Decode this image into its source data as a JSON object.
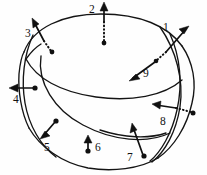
{
  "figure": {
    "background_color": "#fefefe",
    "ink_color": "#111111",
    "width": 207,
    "height": 175,
    "surface": {
      "description": "self-intersecting torus-like closed surface drawn as overlapping elliptical curves",
      "curve_count": 7
    },
    "vectors": [
      {
        "id": "1",
        "label": "1",
        "direction": "up-right",
        "tail_style": "dotted",
        "label_x": 163,
        "label_y": 22,
        "interactable": false
      },
      {
        "id": "2",
        "label": "2",
        "direction": "up",
        "tail_style": "dotted",
        "label_x": 89,
        "label_y": 4,
        "interactable": false
      },
      {
        "id": "3",
        "label": "3",
        "direction": "up-left",
        "tail_style": "dotted",
        "label_x": 25,
        "label_y": 28,
        "interactable": false
      },
      {
        "id": "4",
        "label": "4",
        "direction": "left",
        "tail_style": "solid",
        "label_x": 13,
        "label_y": 94,
        "interactable": false
      },
      {
        "id": "5",
        "label": "5",
        "direction": "down-left",
        "tail_style": "solid",
        "label_x": 44,
        "label_y": 142,
        "interactable": false
      },
      {
        "id": "6",
        "label": "6",
        "direction": "up",
        "tail_style": "solid",
        "label_x": 95,
        "label_y": 142,
        "interactable": false
      },
      {
        "id": "7",
        "label": "7",
        "direction": "up-left",
        "tail_style": "solid",
        "label_x": 127,
        "label_y": 152,
        "interactable": false
      },
      {
        "id": "8",
        "label": "8",
        "direction": "left",
        "tail_style": "dotted",
        "label_x": 160,
        "label_y": 116,
        "interactable": false
      },
      {
        "id": "9",
        "label": "9",
        "direction": "down-left",
        "tail_style": "dotted",
        "label_x": 143,
        "label_y": 68,
        "interactable": false
      }
    ]
  }
}
